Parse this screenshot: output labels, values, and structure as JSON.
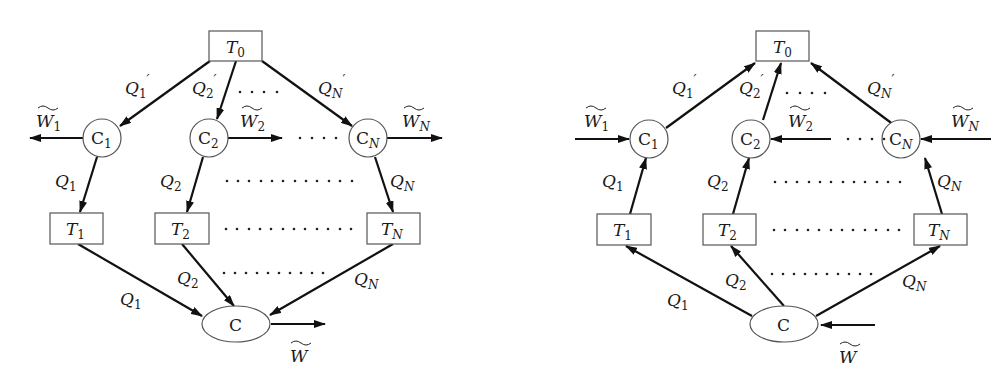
{
  "figure": {
    "panels": [
      {
        "id": "left",
        "description": "Heat engines: heat flows from reservoir T0 through engines C1..CN to T1..TN and then into C, producing work",
        "top_reservoir": {
          "label": "T",
          "sub": "0"
        },
        "engines": [
          {
            "label": "C",
            "sub": "1",
            "work": {
              "label": "W",
              "sub": "1"
            },
            "q_in": {
              "label": "Q",
              "sub": "1",
              "prime": "′"
            },
            "q_out": {
              "label": "Q",
              "sub": "1"
            }
          },
          {
            "label": "C",
            "sub": "2",
            "work": {
              "label": "W",
              "sub": "2"
            },
            "q_in": {
              "label": "Q",
              "sub": "2",
              "prime": "′"
            },
            "q_out": {
              "label": "Q",
              "sub": "2"
            }
          },
          {
            "label": "C",
            "sub": "N",
            "work": {
              "label": "W",
              "sub": "N"
            },
            "q_in": {
              "label": "Q",
              "sub": "N",
              "prime": "′"
            },
            "q_out": {
              "label": "Q",
              "sub": "N"
            }
          }
        ],
        "reservoirs": [
          {
            "label": "T",
            "sub": "1"
          },
          {
            "label": "T",
            "sub": "2"
          },
          {
            "label": "T",
            "sub": "N"
          }
        ],
        "bottom_flows": [
          {
            "label": "Q",
            "sub": "1"
          },
          {
            "label": "Q",
            "sub": "2"
          },
          {
            "label": "Q",
            "sub": "N"
          }
        ],
        "bottom_engine": {
          "label": "C"
        },
        "total_work": {
          "label": "W"
        },
        "ellipsis": ". . . ."
      },
      {
        "id": "right",
        "description": "Reversed (refrigerator) configuration: work input drives heat from T1..TN back to T0",
        "top_reservoir": {
          "label": "T",
          "sub": "0"
        },
        "engines": [
          {
            "label": "C",
            "sub": "1",
            "work": {
              "label": "W",
              "sub": "1"
            },
            "q_in": {
              "label": "Q",
              "sub": "1",
              "prime": "′"
            },
            "q_out": {
              "label": "Q",
              "sub": "1"
            }
          },
          {
            "label": "C",
            "sub": "2",
            "work": {
              "label": "W",
              "sub": "2"
            },
            "q_in": {
              "label": "Q",
              "sub": "2",
              "prime": "′"
            },
            "q_out": {
              "label": "Q",
              "sub": "2"
            }
          },
          {
            "label": "C",
            "sub": "N",
            "work": {
              "label": "W",
              "sub": "N"
            },
            "q_in": {
              "label": "Q",
              "sub": "N",
              "prime": "′"
            },
            "q_out": {
              "label": "Q",
              "sub": "N"
            }
          }
        ],
        "reservoirs": [
          {
            "label": "T",
            "sub": "1"
          },
          {
            "label": "T",
            "sub": "2"
          },
          {
            "label": "T",
            "sub": "N"
          }
        ],
        "bottom_flows": [
          {
            "label": "Q",
            "sub": "1"
          },
          {
            "label": "Q",
            "sub": "2"
          },
          {
            "label": "Q",
            "sub": "N"
          }
        ],
        "bottom_engine": {
          "label": "C"
        },
        "total_work": {
          "label": "W"
        }
      }
    ],
    "dots": {
      "short": "....",
      "long": "............",
      "mid": "..........."
    },
    "colors": {
      "stroke": "#111111",
      "node_border": "#555555",
      "background": "#ffffff"
    }
  }
}
